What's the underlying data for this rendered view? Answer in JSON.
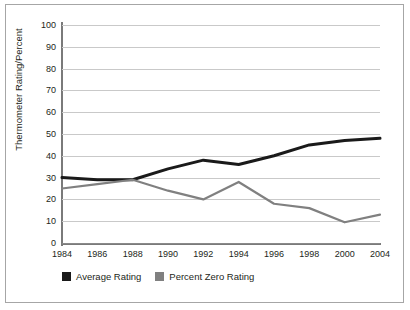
{
  "chart_data": {
    "type": "line",
    "title": "",
    "xlabel": "",
    "ylabel": "Thermometer Rating/Percent",
    "categories": [
      "1984",
      "1986",
      "1988",
      "1990",
      "1992",
      "1994",
      "1996",
      "1998",
      "2000",
      "2004"
    ],
    "x": [
      1984,
      1986,
      1988,
      1990,
      1992,
      1994,
      1996,
      1998,
      2000,
      2004
    ],
    "ylim": [
      0,
      100
    ],
    "yticks": [
      0,
      10,
      20,
      30,
      40,
      50,
      60,
      70,
      80,
      90,
      100
    ],
    "ytick_labels": [
      "0",
      "10",
      "20",
      "30",
      "40",
      "50",
      "60",
      "70",
      "80",
      "90",
      "100"
    ],
    "grid": true,
    "grid_axis": "y",
    "legend_position": "bottom-left",
    "series": [
      {
        "name": "Average Rating",
        "color": "#1a1a1a",
        "line_width": 3,
        "values": [
          30,
          29,
          29,
          34,
          38,
          36,
          40,
          45,
          47,
          48
        ]
      },
      {
        "name": "Percent Zero Rating",
        "color": "#808080",
        "line_width": 2.2,
        "values": [
          25,
          27,
          29,
          24,
          20,
          28,
          18,
          16,
          9.5,
          13
        ]
      }
    ]
  },
  "legend": {
    "items": [
      {
        "label": "Average Rating",
        "swatch_color": "#1a1a1a"
      },
      {
        "label": "Percent Zero Rating",
        "swatch_color": "#808080"
      }
    ]
  },
  "axes": {
    "y_title": "Thermometer Rating/Percent"
  },
  "colors": {
    "frame": "#a6a6a6",
    "gridline": "#c9c9c9",
    "axis": "#7a7a7a",
    "text": "#231f20",
    "background": "#ffffff"
  }
}
